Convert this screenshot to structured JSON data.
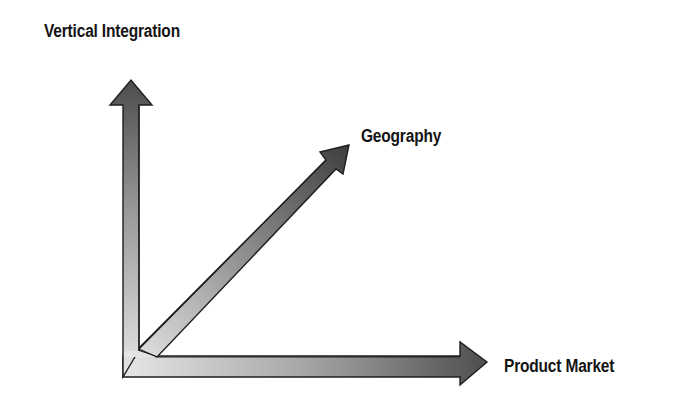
{
  "diagram": {
    "title": "",
    "type": "three-axis growth directions",
    "axes": [
      {
        "id": "vertical",
        "label": "Vertical Integration",
        "direction": "up"
      },
      {
        "id": "geography",
        "label": "Geography",
        "direction": "diagonal-up-right"
      },
      {
        "id": "product",
        "label": "Product Market",
        "direction": "right"
      }
    ],
    "colors": {
      "arrow_dark": "#4a4a4a",
      "arrow_mid": "#8c8c8c",
      "arrow_light": "#e4e4e4",
      "outline": "#1e1e1e",
      "text": "#141414",
      "background": "#ffffff"
    }
  }
}
